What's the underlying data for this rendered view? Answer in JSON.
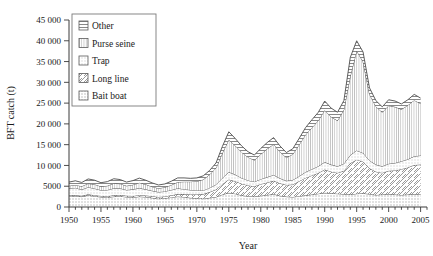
{
  "chart_data": {
    "type": "area",
    "stacked": true,
    "title": "",
    "xlabel": "Year",
    "ylabel": "BFT catch (t)",
    "xlim": [
      1950,
      2006
    ],
    "ylim": [
      0,
      45000
    ],
    "ytick_step": 5000,
    "xtick_step": 5,
    "minor_xticks": "annual",
    "grid": false,
    "legend_position": "top-left",
    "yticks": [
      "0",
      "5000",
      "10 000",
      "15 000",
      "20 000",
      "25 000",
      "30 000",
      "35 000",
      "40 000",
      "45 000"
    ],
    "xticks": [
      "1950",
      "1955",
      "1960",
      "1965",
      "1970",
      "1975",
      "1980",
      "1985",
      "1990",
      "1995",
      "2000",
      "2005"
    ],
    "x": [
      1950,
      1951,
      1952,
      1953,
      1954,
      1955,
      1956,
      1957,
      1958,
      1959,
      1960,
      1961,
      1962,
      1963,
      1964,
      1965,
      1966,
      1967,
      1968,
      1969,
      1970,
      1971,
      1972,
      1973,
      1974,
      1975,
      1976,
      1977,
      1978,
      1979,
      1980,
      1981,
      1982,
      1983,
      1984,
      1985,
      1986,
      1987,
      1988,
      1989,
      1990,
      1991,
      1992,
      1993,
      1994,
      1995,
      1996,
      1997,
      1998,
      1999,
      2000,
      2001,
      2002,
      2003,
      2004,
      2005
    ],
    "series": [
      {
        "name": "Bait boat",
        "pattern": "dotted-square",
        "values": [
          2700,
          2600,
          2500,
          2800,
          2600,
          2400,
          2300,
          2500,
          2600,
          2400,
          2300,
          2500,
          2400,
          2200,
          2000,
          2100,
          2300,
          2500,
          2400,
          2200,
          2100,
          2000,
          2200,
          2400,
          3000,
          3400,
          3200,
          2800,
          2600,
          2500,
          2700,
          2900,
          3100,
          2700,
          2500,
          2400,
          2600,
          2800,
          3000,
          3200,
          3400,
          3300,
          3200,
          3100,
          3000,
          3200,
          3300,
          3100,
          2900,
          3000,
          3100,
          3000,
          2900,
          3000,
          3100,
          3000
        ]
      },
      {
        "name": "Long line",
        "pattern": "diagonal-hatch",
        "values": [
          200,
          200,
          200,
          250,
          250,
          250,
          300,
          300,
          300,
          300,
          350,
          350,
          350,
          400,
          400,
          450,
          500,
          600,
          700,
          800,
          900,
          1100,
          1400,
          1800,
          2500,
          3200,
          3000,
          2800,
          2600,
          2500,
          2800,
          3000,
          3200,
          3000,
          2800,
          3000,
          3600,
          4200,
          4600,
          5000,
          5600,
          5200,
          5000,
          5600,
          7500,
          8200,
          7600,
          6200,
          5600,
          5200,
          5600,
          5800,
          6200,
          6500,
          7000,
          7200
        ]
      },
      {
        "name": "Trap",
        "pattern": "fine-dots",
        "values": [
          1600,
          1800,
          1500,
          1700,
          1600,
          1400,
          1500,
          1700,
          1600,
          1400,
          1600,
          1700,
          1500,
          1300,
          1200,
          1200,
          1300,
          1400,
          1200,
          1100,
          1000,
          900,
          1000,
          1200,
          1500,
          1800,
          1600,
          1400,
          1200,
          1100,
          1200,
          1300,
          1400,
          1200,
          1000,
          1100,
          1200,
          1400,
          1500,
          1600,
          1800,
          1700,
          1600,
          1700,
          2000,
          2200,
          2100,
          1900,
          1700,
          1600,
          1700,
          1800,
          1900,
          2000,
          2100,
          2200
        ]
      },
      {
        "name": "Purse seine",
        "pattern": "vertical-lines",
        "values": [
          600,
          700,
          800,
          900,
          1000,
          900,
          1000,
          1200,
          1100,
          1000,
          1100,
          1300,
          1200,
          1000,
          900,
          1000,
          1200,
          1500,
          1800,
          2000,
          2200,
          2600,
          3200,
          4000,
          6000,
          7800,
          7000,
          6200,
          5600,
          5200,
          6000,
          6800,
          7400,
          6400,
          5600,
          6200,
          7600,
          9000,
          10000,
          11000,
          12500,
          11500,
          11000,
          13000,
          19000,
          24000,
          22000,
          16000,
          14000,
          13000,
          14000,
          13500,
          12500,
          13000,
          13500,
          12500
        ]
      },
      {
        "name": "Other",
        "pattern": "horizontal-lines",
        "values": [
          900,
          1000,
          900,
          1100,
          1000,
          900,
          1000,
          1100,
          1000,
          900,
          1000,
          1100,
          1000,
          900,
          800,
          800,
          900,
          1000,
          900,
          800,
          800,
          900,
          1000,
          1200,
          1600,
          1900,
          1700,
          1500,
          1300,
          1200,
          1400,
          1500,
          1600,
          1400,
          1200,
          1300,
          1500,
          1700,
          1900,
          2000,
          2200,
          2100,
          2000,
          2200,
          4500,
          2400,
          2300,
          1500,
          1400,
          1300,
          1400,
          1400,
          1300,
          1300,
          1400,
          1300
        ]
      }
    ]
  },
  "legend": {
    "items": [
      {
        "label": "Other"
      },
      {
        "label": "Purse seine"
      },
      {
        "label": "Trap"
      },
      {
        "label": "Long line"
      },
      {
        "label": "Bait boat"
      }
    ]
  },
  "colors": {
    "line": "#4d4d4d",
    "text": "#1a1a1a",
    "axis": "#3a3a3a",
    "legend_border": "#7a7a7a"
  }
}
